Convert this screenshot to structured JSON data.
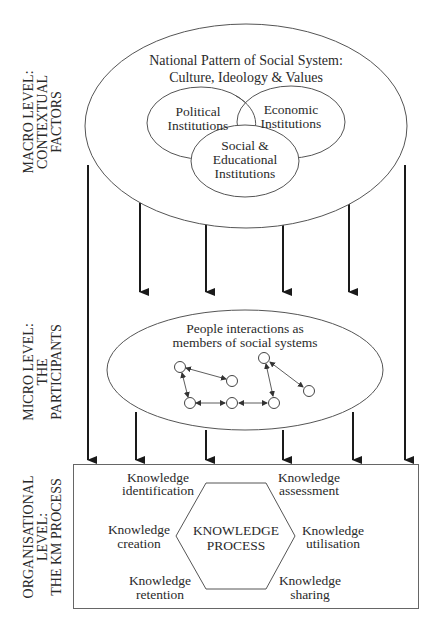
{
  "levels": {
    "macro": {
      "line1": "MACRO LEVEL:",
      "line2": "CONTEXTUAL",
      "line3": "FACTORS"
    },
    "micro": {
      "line1": "MICRO LEVEL:",
      "line2": "THE",
      "line3": "PARTICIPANTS"
    },
    "organisational": {
      "line1": "ORGANISATIONAL",
      "line2": "LEVEL:",
      "line3": "THE KM PROCESS"
    }
  },
  "macro": {
    "title_line1": "National Pattern of Social System:",
    "title_line2": "Culture, Ideology & Values",
    "institutions": [
      {
        "line1": "Political",
        "line2": "Institutions"
      },
      {
        "line1": "Economic",
        "line2": "Institutions"
      },
      {
        "line1": "Social &",
        "line2": "Educational",
        "line3": "Institutions"
      }
    ]
  },
  "micro": {
    "title_line1": "People interactions as",
    "title_line2": "members of social systems"
  },
  "km": {
    "center_line1": "KNOWLEDGE",
    "center_line2": "PROCESS",
    "steps": [
      {
        "line1": "Knowledge",
        "line2": "identification"
      },
      {
        "line1": "Knowledge",
        "line2": "assessment"
      },
      {
        "line1": "Knowledge",
        "line2": "creation"
      },
      {
        "line1": "Knowledge",
        "line2": "utilisation"
      },
      {
        "line1": "Knowledge",
        "line2": "retention"
      },
      {
        "line1": "Knowledge",
        "line2": "sharing"
      }
    ]
  },
  "colors": {
    "ink": "#2a2a2a",
    "line": "#555555",
    "background": "#ffffff"
  }
}
